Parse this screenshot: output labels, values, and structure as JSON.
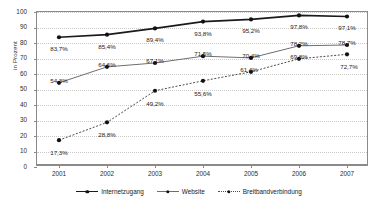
{
  "chart_data": {
    "type": "line",
    "title": "",
    "xlabel": "",
    "ylabel": "in Prozent",
    "ylim": [
      0,
      100
    ],
    "yticks": [
      0,
      10,
      20,
      30,
      40,
      50,
      60,
      70,
      80,
      90,
      100
    ],
    "grid": true,
    "legend_position": "bottom",
    "categories": [
      "2001",
      "2002",
      "2003",
      "2004",
      "2005",
      "2006",
      "2007"
    ],
    "series": [
      {
        "name": "Internetzugang",
        "values": [
          83.7,
          85.4,
          89.4,
          93.8,
          95.2,
          97.8,
          97.1
        ],
        "labels": [
          "83,7%",
          "85,4%",
          "89,4%",
          "93,8%",
          "95,2%",
          "97,8%",
          "97,1%"
        ],
        "color": "#1a1a1a",
        "style": "solid-thick",
        "marker": "circle"
      },
      {
        "name": "Website",
        "values": [
          54.3,
          64.6,
          67.1,
          71.5,
          70.4,
          78.2,
          78.7
        ],
        "labels": [
          "54,3%",
          "64,6%",
          "67,1%",
          "71,5%",
          "70,4%",
          "78,2%",
          "78,7%"
        ],
        "color": "#6e6e6e",
        "style": "solid-thin",
        "marker": "circle"
      },
      {
        "name": "Breitbandverbindung",
        "values": [
          17.3,
          28.8,
          49.2,
          55.6,
          61.4,
          69.8,
          72.7
        ],
        "labels": [
          "17,3%",
          "28,8%",
          "49,2%",
          "55,6%",
          "61,4%",
          "69,8%",
          "72,7%"
        ],
        "color": "#4d4d4d",
        "style": "dotted",
        "marker": "circle"
      }
    ]
  },
  "axis": {
    "y_title": "in Prozent",
    "y_tick_labels": [
      "100",
      "90",
      "80",
      "70",
      "60",
      "50",
      "40",
      "30",
      "20",
      "10",
      "0"
    ],
    "x_tick_labels": [
      "2001",
      "2002",
      "2003",
      "2004",
      "2005",
      "2006",
      "2007"
    ]
  },
  "legend": {
    "items": [
      {
        "label": "Internetzugang"
      },
      {
        "label": "Website"
      },
      {
        "label": "Breitbandverbindung"
      }
    ]
  }
}
